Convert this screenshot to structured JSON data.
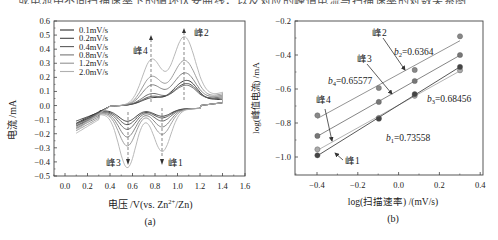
{
  "top_text_fragment": "或电池中不同扫描速率下的循环伏安曲线，以及对应的峰值电流与扫描速率的对数关系图",
  "chart_data": [
    {
      "type": "line",
      "panel_label": "(a)",
      "title": "",
      "xlabel": "电压/V(vs. Zn²⁺/Zn)",
      "ylabel": "电流/mA",
      "xlim": [
        -0.1,
        1.6
      ],
      "ylim": [
        -0.5,
        0.6
      ],
      "xticks": [
        "0.0",
        "0.2",
        "0.4",
        "0.6",
        "0.8",
        "1.0",
        "1.2",
        "1.4",
        "1.6"
      ],
      "xtick_values": [
        0.0,
        0.2,
        0.4,
        0.6,
        0.8,
        1.0,
        1.2,
        1.4,
        1.6
      ],
      "yticks": [
        "0.6",
        "0.5",
        "0.4",
        "0.3",
        "0.2",
        "0.1",
        "0.0",
        "-0.1",
        "-0.2",
        "-0.3",
        "-0.4",
        "-0.5"
      ],
      "ytick_values": [
        0.6,
        0.5,
        0.4,
        0.3,
        0.2,
        0.1,
        0.0,
        -0.1,
        -0.2,
        -0.3,
        -0.4,
        -0.5
      ],
      "legend_position": "upper left",
      "grid": false,
      "series": [
        {
          "name": "0.1mV/s",
          "color": "#2a2a2a",
          "anodic_peaks": {
            "peak4": 0.06,
            "peak2": 0.18
          },
          "cathodic_peaks": {
            "peak3": -0.12,
            "peak1": -0.09
          }
        },
        {
          "name": "0.2mV/s",
          "color": "#444444",
          "anodic_peaks": {
            "peak4": 0.07,
            "peak2": 0.16
          },
          "cathodic_peaks": {
            "peak3": -0.14,
            "peak1": -0.1
          }
        },
        {
          "name": "0.4mV/s",
          "color": "#5c5c5c",
          "anodic_peaks": {
            "peak4": 0.09,
            "peak2": 0.15
          },
          "cathodic_peaks": {
            "peak3": -0.17,
            "peak1": -0.12
          }
        },
        {
          "name": "0.8mV/s",
          "color": "#777777",
          "anodic_peaks": {
            "peak4": 0.15,
            "peak2": 0.24
          },
          "cathodic_peaks": {
            "peak3": -0.22,
            "peak1": -0.16
          }
        },
        {
          "name": "1.2mV/s",
          "color": "#939393",
          "anodic_peaks": {
            "peak4": 0.21,
            "peak2": 0.33
          },
          "cathodic_peaks": {
            "peak3": -0.28,
            "peak1": -0.21
          }
        },
        {
          "name": "2.0mV/s",
          "color": "#b0b0b0",
          "anodic_peaks": {
            "peak4": 0.33,
            "peak2": 0.5
          },
          "cathodic_peaks": {
            "peak3": -0.43,
            "peak1": -0.33
          }
        }
      ],
      "annotations": [
        {
          "label": "峰4",
          "x": 0.77,
          "y": 0.33,
          "direction": "up"
        },
        {
          "label": "峰2",
          "x": 1.06,
          "y": 0.5,
          "direction": "up"
        },
        {
          "label": "峰3",
          "x": 0.56,
          "y": -0.43,
          "direction": "down"
        },
        {
          "label": "峰1",
          "x": 0.86,
          "y": -0.43,
          "direction": "down"
        }
      ]
    },
    {
      "type": "scatter",
      "panel_label": "(b)",
      "title": "",
      "xlabel": "log(扫描速率)/(mV/s)",
      "ylabel": "log(峰值电流)/mA",
      "xlim": [
        -0.5,
        0.45
      ],
      "ylim": [
        -1.1,
        -0.2
      ],
      "xticks": [
        "-0.4",
        "-0.2",
        "0.0",
        "0.2",
        "0.4"
      ],
      "xtick_values": [
        -0.4,
        -0.2,
        0.0,
        0.2,
        0.4
      ],
      "yticks": [
        "-0.2",
        "-0.4",
        "-0.6",
        "-0.8",
        "-1.0"
      ],
      "ytick_values": [
        -0.2,
        -0.4,
        -0.6,
        -0.8,
        -1.0
      ],
      "grid": false,
      "x": [
        -0.398,
        -0.097,
        0.079,
        0.301
      ],
      "series": [
        {
          "name": "峰2",
          "values": [
            -0.755,
            -0.594,
            -0.488,
            -0.29
          ],
          "slope_label": "b₂=0.6364",
          "color": "#888888"
        },
        {
          "name": "峰3",
          "values": [
            -0.876,
            -0.676,
            -0.553,
            -0.4
          ],
          "slope_label": "b₃=0.68456",
          "color": "#777777"
        },
        {
          "name": "峰4",
          "values": [
            -0.955,
            -0.77,
            -0.64,
            -0.49
          ],
          "slope_label": "b₄=0.65577",
          "color": "#aaaaaa"
        },
        {
          "name": "峰1",
          "values": [
            -0.99,
            -0.775,
            -0.63,
            -0.47
          ],
          "slope_label": "b₁=0.73558",
          "color": "#444444"
        }
      ],
      "annotations": [
        {
          "label": "峰2",
          "target": "峰2"
        },
        {
          "label": "峰3",
          "target": "峰3"
        },
        {
          "label": "峰4",
          "target": "峰4"
        },
        {
          "label": "峰1",
          "target": "峰1"
        },
        {
          "label": "b2=0.6364"
        },
        {
          "label": "b4=0.65577"
        },
        {
          "label": "b3=0.68456"
        },
        {
          "label": "b1=0.73558"
        }
      ]
    }
  ],
  "labels": {
    "a": {
      "panel": "(a)",
      "xlabel_prefix": "电压 /V(vs. Zn",
      "xlabel_sup": "2+",
      "xlabel_suffix": "/Zn)",
      "ylabel": "电流 /mA",
      "peak1": "峰1",
      "peak2": "峰2",
      "peak3": "峰3",
      "peak4": "峰4",
      "legend": [
        "0.1mV/s",
        "0.2mV/s",
        "0.4mV/s",
        "0.8mV/s",
        "1.2mV/s",
        "2.0mV/s"
      ],
      "xticks": [
        "0.0",
        "0.2",
        "0.4",
        "0.6",
        "0.8",
        "1.0",
        "1.2",
        "1.4",
        "1.6"
      ],
      "yticks": [
        "0.6",
        "0.5",
        "0.4",
        "0.3",
        "0.2",
        "0.1",
        "0.0",
        "−0.1",
        "−0.2",
        "−0.3",
        "−0.4",
        "−0.5"
      ]
    },
    "b": {
      "panel": "(b)",
      "xlabel": "log(扫描速率) /(mV/s)",
      "ylabel": "log(峰值电流) /mA",
      "peak1": "峰1",
      "peak2": "峰2",
      "peak3": "峰3",
      "peak4": "峰4",
      "b2_sym": "b",
      "b2_sub": "2",
      "b2_val": "=0.6364",
      "b4_sym": "b",
      "b4_sub": "4",
      "b4_val": "=0.65577",
      "b3_sym": "b",
      "b3_sub": "3",
      "b3_val": "=0.68456",
      "b1_sym": "b",
      "b1_sub": "1",
      "b1_val": "=0.73558",
      "xticks": [
        "−0.4",
        "−0.2",
        "0.0",
        "0.2",
        "0.4"
      ],
      "yticks": [
        "−0.2",
        "−0.4",
        "−0.6",
        "−0.8",
        "−1.0"
      ]
    }
  }
}
